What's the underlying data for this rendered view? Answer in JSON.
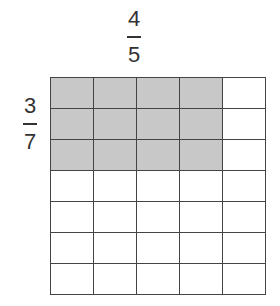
{
  "column_fraction": {
    "numerator": "4",
    "denominator": "5"
  },
  "row_fraction": {
    "numerator": "3",
    "denominator": "7"
  },
  "grid": {
    "columns": 5,
    "rows": 7,
    "shaded_columns": 4,
    "shaded_rows": 3,
    "shade_color": "#c8c8c8",
    "line_color": "#444444"
  }
}
